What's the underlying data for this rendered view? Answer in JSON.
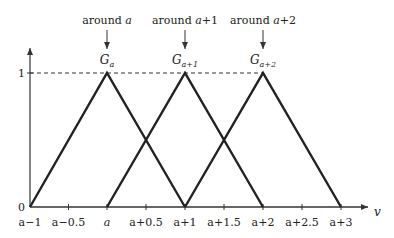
{
  "diagram": {
    "type": "triangular membership functions",
    "y_axis": {
      "ticks": [
        {
          "value": 0,
          "label": "0"
        },
        {
          "value": 1,
          "label": "1"
        }
      ]
    },
    "x_axis": {
      "label": "v",
      "ticks": [
        {
          "value": -1,
          "label": "a−1"
        },
        {
          "value": -0.5,
          "label": "a−0.5"
        },
        {
          "value": 0,
          "label": "a"
        },
        {
          "value": 0.5,
          "label": "a+0.5"
        },
        {
          "value": 1,
          "label": "a+1"
        },
        {
          "value": 1.5,
          "label": "a+1.5"
        },
        {
          "value": 2,
          "label": "a+2"
        },
        {
          "value": 2.5,
          "label": "a+2.5"
        },
        {
          "value": 3,
          "label": "a+3"
        }
      ]
    },
    "functions": [
      {
        "name": "G",
        "subscript": "a",
        "peak": 0,
        "left": -1,
        "right": 1,
        "annotation_prefix": "around ",
        "annotation_var": "a",
        "annotation_suffix": ""
      },
      {
        "name": "G",
        "subscript": "a+1",
        "peak": 1,
        "left": 0,
        "right": 2,
        "annotation_prefix": "around ",
        "annotation_var": "a",
        "annotation_suffix": "+1"
      },
      {
        "name": "G",
        "subscript": "a+2",
        "peak": 2,
        "left": 1,
        "right": 3,
        "annotation_prefix": "around ",
        "annotation_var": "a",
        "annotation_suffix": "+2"
      }
    ],
    "colors": {
      "line": "#222222",
      "axis": "#333333",
      "text": "#222222"
    }
  }
}
